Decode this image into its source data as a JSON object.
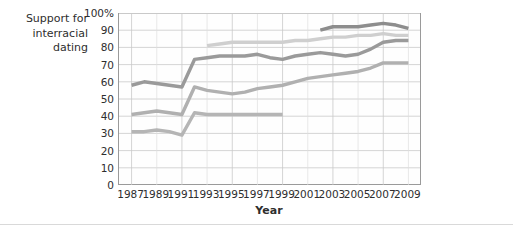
{
  "figure": {
    "y_axis_title": "Support for\ninterracial\ndating",
    "x_axis_title": "Year"
  },
  "legend": {
    "items": [
      {
        "label": "Born 1977+",
        "color": "#8d8d8d"
      },
      {
        "label": "Born 1965–76",
        "color": "#cfcfcf"
      },
      {
        "label": "Born 1946–64",
        "color": "#9a9a9a"
      },
      {
        "label": "Born 1928–45",
        "color": "#b0b0b0"
      }
    ]
  },
  "inline_labels": [
    {
      "label": "Born <1928",
      "color": "#b5b5b5"
    }
  ],
  "chart_data": {
    "type": "line",
    "title": "",
    "subtitle": "",
    "xlabel": "Year",
    "ylabel": "Support for interracial dating",
    "xlim": [
      1986,
      2010
    ],
    "ylim": [
      0,
      100
    ],
    "grid": true,
    "legend_position": "right-inline",
    "x_ticks": [
      1987,
      1989,
      1991,
      1993,
      1995,
      1997,
      1999,
      2001,
      2003,
      2005,
      2007,
      2009
    ],
    "y_ticks": [
      0,
      10,
      20,
      30,
      40,
      50,
      60,
      70,
      80,
      90,
      100
    ],
    "y_tick_labels": [
      "0",
      "10",
      "20",
      "30",
      "40",
      "50",
      "60",
      "70",
      "80",
      "90",
      "100%"
    ],
    "series": [
      {
        "name": "Born 1977+",
        "color": "#8d8d8d",
        "x": [
          2002,
          2003,
          2004,
          2005,
          2006,
          2007,
          2008,
          2009
        ],
        "values": [
          90,
          92,
          92,
          92,
          93,
          94,
          93,
          91
        ]
      },
      {
        "name": "Born 1965–76",
        "color": "#cfcfcf",
        "x": [
          1993,
          1994,
          1995,
          1996,
          1997,
          1998,
          1999,
          2000,
          2001,
          2002,
          2003,
          2004,
          2005,
          2006,
          2007,
          2008,
          2009
        ],
        "values": [
          81,
          82,
          83,
          83,
          83,
          83,
          83,
          84,
          84,
          85,
          86,
          86,
          87,
          87,
          88,
          87,
          87
        ]
      },
      {
        "name": "Born 1946–64",
        "color": "#9a9a9a",
        "x": [
          1987,
          1988,
          1989,
          1990,
          1991,
          1992,
          1993,
          1994,
          1995,
          1996,
          1997,
          1998,
          1999,
          2000,
          2001,
          2002,
          2003,
          2004,
          2005,
          2006,
          2007,
          2008,
          2009
        ],
        "values": [
          58,
          60,
          59,
          58,
          57,
          73,
          74,
          75,
          75,
          75,
          76,
          74,
          73,
          75,
          76,
          77,
          76,
          75,
          76,
          79,
          83,
          84,
          84
        ]
      },
      {
        "name": "Born 1928–45",
        "color": "#b0b0b0",
        "x": [
          1987,
          1988,
          1989,
          1990,
          1991,
          1992,
          1993,
          1994,
          1995,
          1996,
          1997,
          1998,
          1999,
          2000,
          2001,
          2002,
          2003,
          2004,
          2005,
          2006,
          2007,
          2008,
          2009
        ],
        "values": [
          41,
          42,
          43,
          42,
          41,
          57,
          55,
          54,
          53,
          54,
          56,
          57,
          58,
          60,
          62,
          63,
          64,
          65,
          66,
          68,
          71,
          71,
          71
        ]
      },
      {
        "name": "Born <1928",
        "color": "#b5b5b5",
        "x": [
          1987,
          1988,
          1989,
          1990,
          1991,
          1992,
          1993,
          1994,
          1995,
          1996,
          1997,
          1998,
          1999
        ],
        "values": [
          31,
          31,
          32,
          31,
          29,
          42,
          41,
          41,
          41,
          41,
          41,
          41,
          41
        ]
      }
    ]
  }
}
